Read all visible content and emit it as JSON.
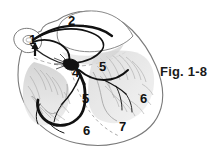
{
  "figure": {
    "caption": "Fig. 1-8",
    "style": "line-art-anatomical-illustration",
    "colors": {
      "background": "#ffffff",
      "outline": "#6b6b6b",
      "conduction_path": "#000000",
      "shading": "#b8b8b8",
      "label_text": "#111111"
    }
  },
  "labels": [
    {
      "id": "label-1",
      "text": "1",
      "x": 33,
      "y": 41,
      "has_arrow": true,
      "arrow_dir": "up"
    },
    {
      "id": "label-2",
      "text": "2",
      "x": 70,
      "y": 21,
      "has_arrow": false,
      "arrow_dir": ""
    },
    {
      "id": "label-4",
      "text": "4",
      "x": 74,
      "y": 73,
      "has_arrow": false,
      "arrow_dir": ""
    },
    {
      "id": "label-5-right",
      "text": "5",
      "x": 98,
      "y": 66,
      "has_arrow": false,
      "arrow_dir": ""
    },
    {
      "id": "label-5-left",
      "text": "5",
      "x": 84,
      "y": 98,
      "has_arrow": false,
      "arrow_dir": ""
    },
    {
      "id": "label-6-right",
      "text": "6",
      "x": 139,
      "y": 97,
      "has_arrow": false,
      "arrow_dir": ""
    },
    {
      "id": "label-6-bottom",
      "text": "6",
      "x": 84,
      "y": 127,
      "has_arrow": false,
      "arrow_dir": ""
    },
    {
      "id": "label-7",
      "text": "7",
      "x": 119,
      "y": 123,
      "has_arrow": false,
      "arrow_dir": ""
    }
  ]
}
